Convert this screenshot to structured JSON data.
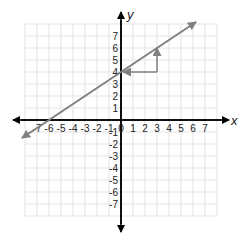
{
  "chart_data": {
    "type": "line",
    "title": "",
    "xlabel": "x",
    "ylabel": "y",
    "xlim": [
      -8,
      8
    ],
    "ylim": [
      -8,
      8
    ],
    "grid": true,
    "x_ticks": [
      -7,
      -6,
      -5,
      -4,
      -3,
      -2,
      -1,
      0,
      1,
      2,
      3,
      4,
      5,
      6,
      7
    ],
    "y_ticks": [
      -7,
      -6,
      -5,
      -4,
      -3,
      -2,
      -1,
      1,
      2,
      3,
      4,
      5,
      6,
      7
    ],
    "x_tick_labels": [
      "-7",
      "-6",
      "-5",
      "-4",
      "-3",
      "-2",
      "-1",
      "0",
      "1",
      "2",
      "3",
      "4",
      "5",
      "6",
      "7"
    ],
    "y_tick_labels": [
      "-7",
      "-6",
      "-5",
      "-4",
      "-3",
      "-2",
      "-1",
      "1",
      "2",
      "3",
      "4",
      "5",
      "6",
      "7"
    ],
    "series": [
      {
        "name": "line",
        "equation": "y = (2/3)x + 4",
        "slope": 0.6667,
        "intercept": 4,
        "x": [
          -8.25,
          6.25
        ],
        "y": [
          -1.5,
          8.17
        ],
        "arrows_both_ends": true,
        "color": "#808080"
      }
    ],
    "annotations": [
      {
        "type": "slope-triangle",
        "run": {
          "from": [
            3,
            4
          ],
          "to": [
            0,
            4
          ],
          "arrow_at_end": true
        },
        "rise": {
          "from": [
            3,
            4
          ],
          "to": [
            3,
            6
          ],
          "arrow_at_end": true
        },
        "color": "#808080"
      }
    ],
    "key_points": [
      {
        "label": "y-intercept",
        "x": 0,
        "y": 4
      },
      {
        "label": "x-intercept",
        "x": -6,
        "y": 0
      },
      {
        "label": "rise-end",
        "x": 3,
        "y": 6
      }
    ]
  },
  "colors": {
    "axis": "#000000",
    "grid": "#e3e3e3",
    "line": "#808080",
    "text": "#222222"
  },
  "labels": {
    "x_axis": "x",
    "y_axis": "y"
  }
}
